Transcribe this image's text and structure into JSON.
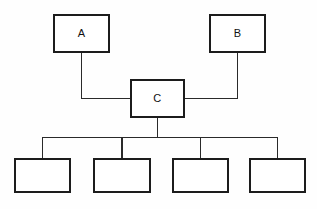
{
  "diagram": {
    "canvas": {
      "width": 317,
      "height": 209,
      "background": "#fefefe"
    },
    "style": {
      "box_stroke": "#1c1c1c",
      "box_fill": "#ffffff",
      "line_stroke": "#2a2a2a",
      "label_color": "#111111"
    },
    "nodes": [
      {
        "id": "node-a",
        "label": "A",
        "x": 54,
        "y": 15,
        "w": 55,
        "h": 37,
        "label_x": 81.5,
        "label_y": 34
      },
      {
        "id": "node-b",
        "label": "B",
        "x": 210,
        "y": 15,
        "w": 55,
        "h": 37,
        "label_x": 237.5,
        "label_y": 34
      },
      {
        "id": "node-c",
        "label": "C",
        "x": 131,
        "y": 80,
        "w": 53,
        "h": 37,
        "label_x": 157.5,
        "label_y": 99
      },
      {
        "id": "node-child-1",
        "label": "",
        "x": 15,
        "y": 159,
        "w": 55,
        "h": 33,
        "label_x": 42.5,
        "label_y": 175
      },
      {
        "id": "node-child-2",
        "label": "",
        "x": 94,
        "y": 159,
        "w": 56,
        "h": 33,
        "label_x": 122,
        "label_y": 175
      },
      {
        "id": "node-child-3",
        "label": "",
        "x": 173,
        "y": 159,
        "w": 55,
        "h": 33,
        "label_x": 200.5,
        "label_y": 175
      },
      {
        "id": "node-child-4",
        "label": "",
        "x": 250,
        "y": 159,
        "w": 55,
        "h": 33,
        "label_x": 277.5,
        "label_y": 175
      }
    ],
    "connectors": [
      {
        "id": "edge-a-to-c",
        "from": "node-a",
        "to": "node-c",
        "path": "M 81.5 52 L 81.5 98.5 L 131 98.5"
      },
      {
        "id": "edge-b-to-c",
        "from": "node-b",
        "to": "node-c",
        "path": "M 237.5 52 L 237.5 98.5 L 184 98.5"
      },
      {
        "id": "edge-c-to-bus",
        "from": "node-c",
        "to": "bus",
        "path": "M 157.5 117 L 157.5 137.5"
      },
      {
        "id": "edge-bus",
        "from": "bus",
        "to": "bus",
        "path": "M 42.5 137.5 L 277.5 137.5"
      },
      {
        "id": "edge-bus-to-child-1",
        "from": "bus",
        "to": "node-child-1",
        "path": "M 42.5 137.5 L 42.5 159"
      },
      {
        "id": "edge-bus-to-child-2",
        "from": "bus",
        "to": "node-child-2",
        "path": "M 122 137.5 L 122 159"
      },
      {
        "id": "edge-bus-to-child-3",
        "from": "bus",
        "to": "node-child-3",
        "path": "M 200.5 137.5 L 200.5 159"
      },
      {
        "id": "edge-bus-to-child-4",
        "from": "bus",
        "to": "node-child-4",
        "path": "M 277.5 137.5 L 277.5 159"
      }
    ]
  }
}
